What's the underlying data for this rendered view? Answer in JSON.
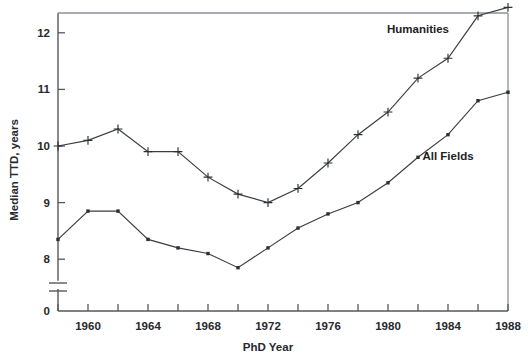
{
  "chart_data": {
    "type": "line",
    "title": "",
    "xlabel": "PhD Year",
    "ylabel": "Median TTD, years",
    "xlim": [
      1958,
      1988
    ],
    "ylim": [
      7.55,
      12.55
    ],
    "y_axis_break": true,
    "y_break_note": "axis broken between 0 and ~7.6",
    "grid": false,
    "legend_position": "inline-annotations",
    "x_tick_values": [
      1958,
      1960,
      1962,
      1964,
      1966,
      1968,
      1970,
      1972,
      1974,
      1976,
      1978,
      1980,
      1982,
      1984,
      1986,
      1988
    ],
    "x_tick_labels": [
      "",
      "1960",
      "",
      "1964",
      "",
      "1968",
      "",
      "1972",
      "",
      "1976",
      "",
      "1980",
      "",
      "1984",
      "",
      "1988"
    ],
    "y_tick_values": [
      8,
      9,
      10,
      11,
      12
    ],
    "y_tick_labels": [
      "8",
      "9",
      "10",
      "11",
      "12"
    ],
    "y_zero_label": "0",
    "series": [
      {
        "name": "Humanities",
        "marker": "plus",
        "x": [
          1958,
          1960,
          1962,
          1964,
          1966,
          1968,
          1970,
          1972,
          1974,
          1976,
          1978,
          1980,
          1982,
          1984,
          1986,
          1988
        ],
        "values": [
          10.0,
          10.1,
          10.3,
          9.9,
          9.9,
          9.45,
          9.15,
          9.0,
          9.25,
          9.7,
          10.2,
          10.6,
          11.2,
          11.55,
          12.3,
          12.45
        ]
      },
      {
        "name": "All Fields",
        "marker": "square",
        "x": [
          1958,
          1960,
          1962,
          1964,
          1966,
          1968,
          1970,
          1972,
          1974,
          1976,
          1978,
          1980,
          1982,
          1984,
          1986,
          1988
        ],
        "values": [
          8.35,
          8.85,
          8.85,
          8.35,
          8.2,
          8.1,
          7.85,
          8.2,
          8.55,
          8.8,
          9.0,
          9.35,
          9.8,
          10.2,
          10.8,
          10.95
        ]
      }
    ],
    "annotations": [
      {
        "text": "Humanities",
        "x": 1982,
        "y": 12.0
      },
      {
        "text": "All Fields",
        "x": 1984,
        "y": 9.75
      }
    ],
    "colors": {
      "line": "#3a3d42",
      "marker": "#2c2f33",
      "axis": "#55585c",
      "frame": "#8d9196",
      "text": "#26292d",
      "background": "#ffffff"
    }
  }
}
